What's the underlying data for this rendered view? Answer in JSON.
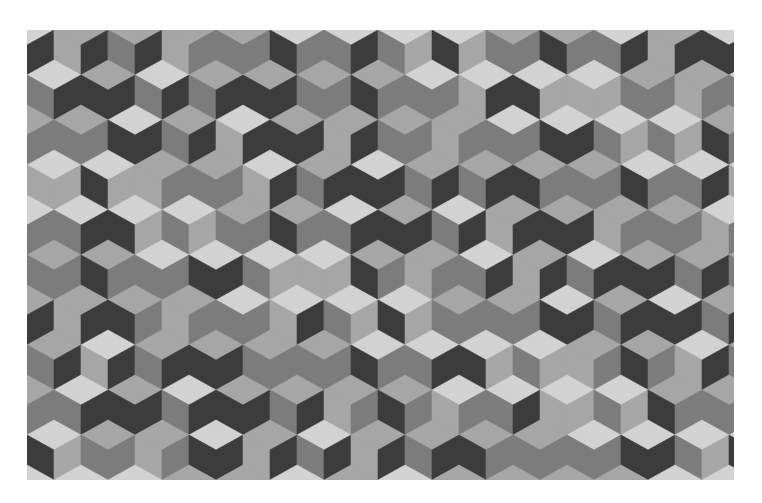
{
  "image": {
    "description": "Isometric tumbling-blocks cube tessellation in grayscale",
    "frame": {
      "x": 27,
      "y": 30,
      "width": 707,
      "height": 450
    },
    "geometry": {
      "hex_width": 54,
      "side": 30,
      "row_step": 45,
      "row_offset": 27
    },
    "palette": [
      "#d2d2d2",
      "#a6a6a6",
      "#7c7c7c",
      "#3c3c3c"
    ],
    "face_patterns": {
      "top": [
        0,
        1,
        0,
        1,
        1,
        0,
        1,
        0,
        0,
        1,
        1,
        0,
        1
      ],
      "left": [
        2,
        3,
        1,
        2,
        3,
        2,
        1,
        3,
        2,
        2,
        3,
        1,
        2
      ],
      "right": [
        3,
        2,
        2,
        3,
        1,
        3,
        2,
        2,
        3,
        1,
        2,
        3,
        3
      ]
    }
  }
}
